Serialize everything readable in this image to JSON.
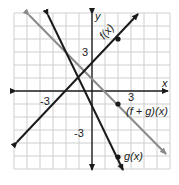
{
  "graph": {
    "axes": {
      "x_label": "x",
      "y_label": "y",
      "x_ticks": [
        "-3",
        "3"
      ],
      "y_ticks": [
        "3",
        "-3"
      ],
      "range": [
        -6,
        6
      ]
    },
    "functions": [
      {
        "name": "f",
        "label": "f(x)",
        "equation": "x + 2",
        "marked_point": [
          2,
          4
        ],
        "color": "#1a1a1a"
      },
      {
        "name": "g",
        "label": "g(x)",
        "equation": "-2x - 1",
        "marked_point": [
          2,
          -5
        ],
        "color": "#1a1a1a"
      },
      {
        "name": "f+g",
        "label": "(f + g)(x)",
        "equation": "-x + 1",
        "marked_point": [
          2,
          -1
        ],
        "color": "#8a8a8a"
      }
    ],
    "colors": {
      "grid": "#cfcfcf",
      "axis": "#1a1a1a",
      "sum_line": "#8a8a8a"
    }
  }
}
